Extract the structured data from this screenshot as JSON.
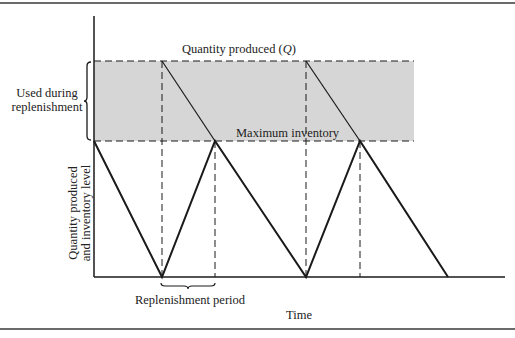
{
  "diagram": {
    "type": "inventory-replenishment-sawtooth",
    "labels": {
      "quantity_produced": "Quantity produced (",
      "quantity_symbol": "Q",
      "quantity_close": ")",
      "maximum_inventory": "Maximum inventory",
      "used_during_line1": "Used during",
      "used_during_line2": "replenishment",
      "y_axis_line1": "Quantity produced",
      "y_axis_line2": "and inventory level",
      "replenishment_period": "Replenishment period",
      "x_axis": "Time"
    },
    "colors": {
      "shade": "#d6d6d6",
      "line": "#1a1a1a",
      "frame": "#6a6a6a"
    },
    "geometry": {
      "axis_x": 94,
      "axis_top": 16,
      "baseline_y": 277,
      "q_level_y": 61,
      "max_inventory_y": 141,
      "shade_right": 414,
      "inventory_path": [
        [
          94,
          141
        ],
        [
          162,
          277
        ],
        [
          215,
          141
        ],
        [
          306,
          277
        ],
        [
          360,
          141
        ],
        [
          448,
          277
        ]
      ],
      "production_lines": [
        [
          [
            162,
            61
          ],
          [
            215,
            141
          ]
        ],
        [
          [
            306,
            61
          ],
          [
            360,
            141
          ]
        ]
      ],
      "dashed_verticals": [
        162,
        215,
        306,
        360
      ]
    }
  }
}
